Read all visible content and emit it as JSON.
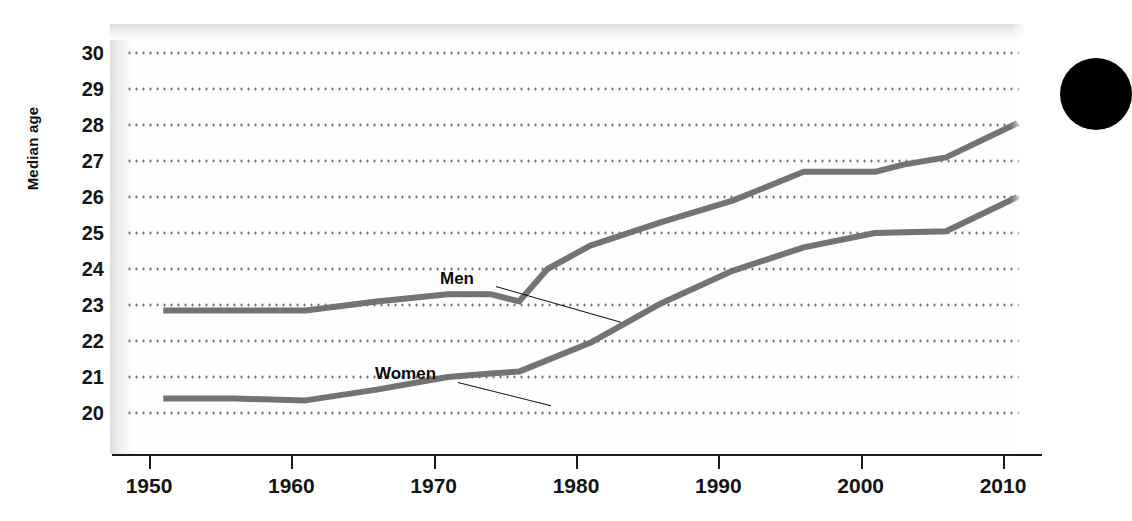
{
  "chart_data": {
    "type": "line",
    "title": "",
    "subtitle": "",
    "xlabel": "",
    "ylabel": "Median age",
    "xlim": [
      1948,
      2013
    ],
    "ylim": [
      19.5,
      30.5
    ],
    "grid": true,
    "grid_style": "dotted-horizontal",
    "legend_position": "inline-annotations",
    "x_ticks": [
      1950,
      1960,
      1970,
      1980,
      1990,
      2000,
      2010
    ],
    "x_tick_labels": [
      "1950",
      "1960",
      "1970",
      "1980",
      "1990",
      "2000",
      "2010"
    ],
    "y_ticks": [
      20,
      21,
      22,
      23,
      24,
      25,
      26,
      27,
      28,
      29,
      30
    ],
    "y_tick_labels": [
      "30",
      "29",
      "28",
      "27",
      "26",
      "25",
      "24",
      "23",
      "22",
      "21",
      "20"
    ],
    "series": [
      {
        "name": "Men",
        "color": "#737373",
        "x": [
          1951,
          1956,
          1961,
          1966,
          1971,
          1974,
          1976,
          1978,
          1981,
          1986,
          1991,
          1996,
          2001,
          2003,
          2006,
          2011
        ],
        "values": [
          22.85,
          22.85,
          22.85,
          23.1,
          23.3,
          23.3,
          23.1,
          24.0,
          24.65,
          25.3,
          25.9,
          26.7,
          26.7,
          26.9,
          27.1,
          28.05
        ]
      },
      {
        "name": "Women",
        "color": "#737373",
        "x": [
          1951,
          1956,
          1961,
          1966,
          1971,
          1974,
          1976,
          1981,
          1986,
          1991,
          1996,
          2001,
          2006,
          2011
        ],
        "values": [
          20.4,
          20.4,
          20.35,
          20.65,
          21.0,
          21.1,
          21.15,
          21.95,
          23.05,
          23.95,
          24.6,
          25.0,
          25.05,
          26.0
        ]
      }
    ],
    "annotations": [
      {
        "text": "Men",
        "series": "Men",
        "anchor_x": 1976,
        "anchor_y": 23.1
      },
      {
        "text": "Women",
        "series": "Women",
        "anchor_x": 1976,
        "anchor_y": 21.15
      }
    ]
  },
  "axes": {
    "y_title": "Median age"
  },
  "decor": {
    "bullet_color": "#000000"
  }
}
